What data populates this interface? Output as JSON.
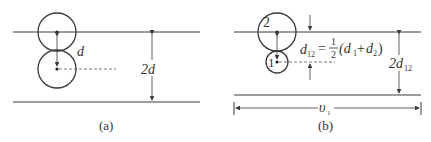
{
  "panel_a": {
    "caption": "(a)",
    "spacing_label": "d",
    "height_label": "2d"
  },
  "panel_b": {
    "caption": "(b)",
    "molecule_large_label": "2",
    "molecule_small_label": "1",
    "formula": {
      "lhs": "d",
      "lhs_sub": "12",
      "equals": "=",
      "frac_num": "1",
      "frac_den": "2",
      "rhs_open": "(d",
      "rhs_sub1": "1",
      "rhs_plus": "+",
      "rhs_d2": "d",
      "rhs_sub2": "2",
      "rhs_close": ")"
    },
    "height_label": "2d",
    "height_label_sub": "12",
    "velocity_label": "υ",
    "velocity_sub": "1"
  },
  "colors": {
    "line": "#3a3a3a",
    "text": "#333333",
    "dashed": "#555555"
  }
}
